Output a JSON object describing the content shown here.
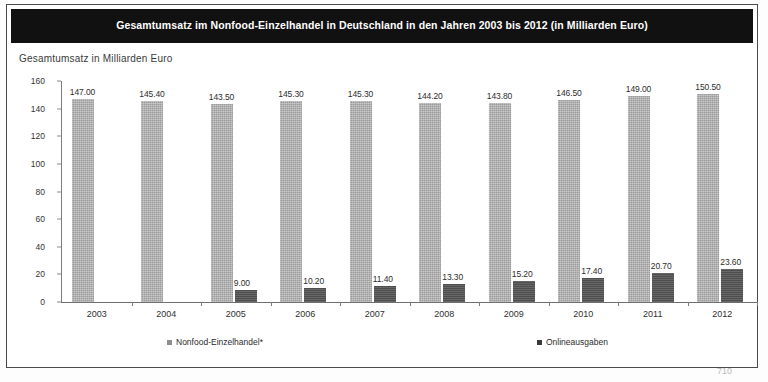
{
  "figure": {
    "title": "Gesamtumsatz im Nonfood-Einzelhandel in Deutschland in den Jahren 2003 bis 2012 (in Milliarden Euro)",
    "axis_caption": "Gesamtumsatz in Milliarden Euro",
    "title_bar_color": "#111111",
    "frame_color": "#4a4a4a"
  },
  "page": {
    "caption": "",
    "page_number": "710"
  },
  "legend": {
    "items": [
      {
        "label": "Nonfood-Einzelhandel*",
        "color": "#8f8f8f",
        "marker": "square-marker"
      },
      {
        "label": "Onlineausgaben",
        "color": "#3a3a3a",
        "marker": "square-marker"
      }
    ]
  },
  "chart_data": {
    "type": "bar",
    "title": "Gesamtumsatz im Nonfood-Einzelhandel in Deutschland in den Jahren 2003 bis 2012 (in Milliarden Euro)",
    "xlabel": "",
    "ylabel": "Gesamtumsatz in Milliarden Euro",
    "ylim": [
      0,
      160
    ],
    "yticks": [
      0,
      20,
      40,
      60,
      80,
      100,
      120,
      140,
      160
    ],
    "ytick_labels": [
      "0",
      "20",
      "40",
      "60",
      "80",
      "100",
      "120",
      "140",
      "160"
    ],
    "grid": false,
    "legend_position": "bottom",
    "categories": [
      "2003",
      "2004",
      "2005",
      "2006",
      "2007",
      "2008",
      "2009",
      "2010",
      "2011",
      "2012"
    ],
    "series": [
      {
        "name": "Nonfood-Einzelhandel*",
        "color": "#9b9b9b",
        "values": [
          147.0,
          145.4,
          143.5,
          145.3,
          145.3,
          144.2,
          143.8,
          146.5,
          149.0,
          150.5
        ],
        "labels": [
          "147.00",
          "145.40",
          "143.50",
          "145.30",
          "145.30",
          "144.20",
          "143.80",
          "146.50",
          "149.00",
          "150.50"
        ]
      },
      {
        "name": "Onlineausgaben",
        "color": "#4e4e4e",
        "values": [
          null,
          null,
          9.0,
          10.2,
          11.4,
          13.3,
          15.2,
          17.4,
          20.7,
          23.6
        ],
        "labels": [
          "",
          "",
          "9.00",
          "10.20",
          "11.40",
          "13.30",
          "15.20",
          "17.40",
          "20.70",
          "23.60"
        ]
      }
    ]
  }
}
